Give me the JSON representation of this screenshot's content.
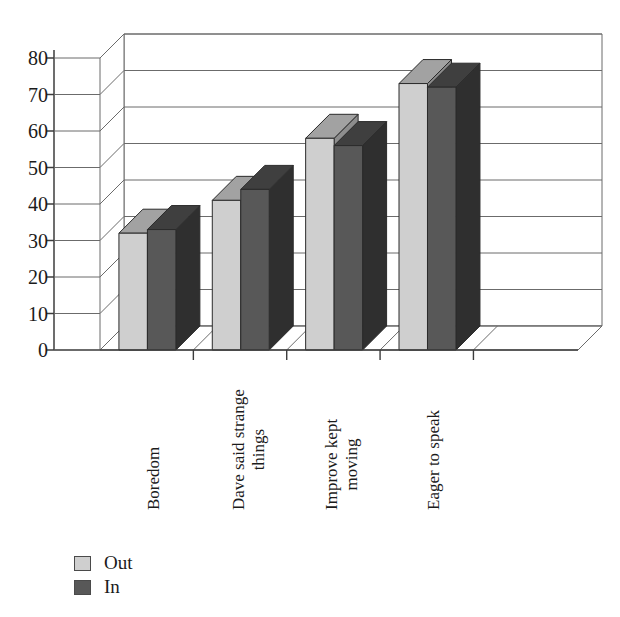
{
  "chart_data": {
    "type": "bar",
    "title": "",
    "subtitle": "",
    "xlabel": "",
    "ylabel": "",
    "ylim": [
      0,
      80
    ],
    "ytick_interval": 10,
    "yticks": [
      "80",
      "70",
      "60",
      "50",
      "40",
      "30",
      "20",
      "10",
      "0"
    ],
    "grid": true,
    "three_d": true,
    "legend_position": "bottom-left",
    "categories": [
      "Boredom",
      "Dave said strange things",
      "Improve kept moving",
      "Eager to speak"
    ],
    "category_lines": [
      [
        "Boredom"
      ],
      [
        "Dave said strange",
        "things"
      ],
      [
        "Improve kept",
        "moving"
      ],
      [
        "Eager to speak"
      ]
    ],
    "series": [
      {
        "name": "Out",
        "color": "#cfcfcf",
        "values": [
          32,
          41,
          58,
          73
        ]
      },
      {
        "name": "In",
        "color": "#585858",
        "values": [
          33,
          44,
          56,
          72
        ]
      }
    ]
  },
  "legend": {
    "items": [
      {
        "label": "Out",
        "swatch": "out"
      },
      {
        "label": "In",
        "swatch": "in"
      }
    ]
  },
  "colors": {
    "series_out_face": "#cfcfcf",
    "series_out_top": "#9a9a9a",
    "series_out_side": "#7d7d7d",
    "series_in_face": "#585858",
    "series_in_top": "#3a3a3a",
    "series_in_side": "#2d2d2d",
    "axis": "#3c3c3c",
    "grid": "#6b6b6b",
    "background": "#ffffff",
    "text": "#1b1b1b"
  }
}
